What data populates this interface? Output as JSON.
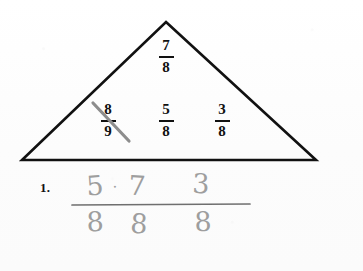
{
  "page": {
    "background_color": "#fdfdfd",
    "ink_color": "#111111",
    "pencil_color": "#9e9e9e"
  },
  "triangle": {
    "apex": {
      "x": 166,
      "y": 22
    },
    "base_left": {
      "x": 22,
      "y": 160
    },
    "base_right": {
      "x": 316,
      "y": 160
    },
    "stroke_color": "#111111",
    "stroke_width": 2.6
  },
  "printed_fractions": [
    {
      "id": "top",
      "numerator": "7",
      "denominator": "8",
      "crossed_out": false
    },
    {
      "id": "left",
      "numerator": "8",
      "denominator": "9",
      "crossed_out": true
    },
    {
      "id": "middle",
      "numerator": "5",
      "denominator": "8",
      "crossed_out": false
    },
    {
      "id": "right",
      "numerator": "3",
      "denominator": "8",
      "crossed_out": false
    }
  ],
  "strikethrough": {
    "color": "#8d8d8d",
    "from": {
      "x": 93,
      "y": 103
    },
    "to": {
      "x": 128,
      "y": 140
    }
  },
  "answer": {
    "problem_number": "1.",
    "numerators": [
      "5",
      "7",
      "3"
    ],
    "separator": "·",
    "denominators": [
      "8",
      "8",
      "8"
    ],
    "fraction_bar": {
      "x1": 72,
      "x2": 250,
      "y": 205,
      "color": "#6f6f6f"
    }
  }
}
